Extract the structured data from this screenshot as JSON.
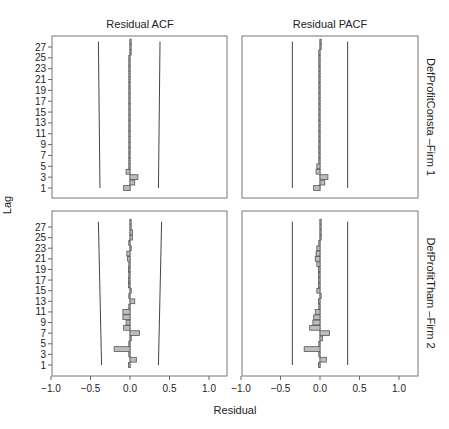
{
  "figure": {
    "col_titles": [
      "Residual ACF",
      "Residual PACF"
    ],
    "row_titles": [
      "DefProfitConsta –Firm 1",
      "DefProfitTham –Firm 2"
    ],
    "xlabel": "Residual",
    "ylabel": "Lag"
  },
  "chart_data": {
    "type": "bar",
    "orientation": "horizontal",
    "layout": "2x2 facet grid",
    "xlabel": "Residual",
    "ylabel": "Lag",
    "xlim": [
      -1.0,
      1.25
    ],
    "xticks": [
      -1.0,
      -0.5,
      0.0,
      0.5,
      1.0
    ],
    "xtick_labels": [
      "−1.0",
      "−0.5",
      "0.0",
      "0.5",
      "1.0"
    ],
    "yticks": [
      1,
      3,
      5,
      7,
      9,
      11,
      13,
      15,
      17,
      19,
      21,
      23,
      25,
      27
    ],
    "lags": [
      1,
      2,
      3,
      4,
      5,
      6,
      7,
      8,
      9,
      10,
      11,
      12,
      13,
      14,
      15,
      16,
      17,
      18,
      19,
      20,
      21,
      22,
      23,
      24,
      25,
      26,
      27,
      28
    ],
    "grid": false,
    "panels": [
      {
        "title": "Residual ACF",
        "row": "DefProfitConsta –Firm 1",
        "values": [
          -0.08,
          0.06,
          0.1,
          -0.05,
          -0.01,
          -0.01,
          -0.01,
          -0.01,
          -0.01,
          -0.01,
          -0.01,
          -0.01,
          -0.01,
          -0.01,
          -0.01,
          -0.01,
          -0.01,
          -0.01,
          -0.01,
          -0.01,
          -0.01,
          -0.01,
          -0.01,
          -0.01,
          -0.01,
          0.0,
          0.0,
          0.0
        ],
        "conf_band": {
          "lower_start": -0.38,
          "lower_end": -0.4,
          "upper_start": 0.36,
          "upper_end": 0.38
        }
      },
      {
        "title": "Residual PACF",
        "row": "DefProfitConsta –Firm 1",
        "values": [
          -0.08,
          0.06,
          0.1,
          -0.05,
          -0.04,
          -0.01,
          -0.01,
          -0.01,
          -0.01,
          -0.01,
          -0.01,
          -0.01,
          -0.01,
          -0.01,
          -0.01,
          -0.01,
          -0.01,
          -0.01,
          -0.01,
          -0.01,
          -0.01,
          -0.01,
          -0.01,
          -0.01,
          -0.01,
          -0.01,
          0.0,
          0.0
        ],
        "conf_band": {
          "lower": -0.35,
          "upper": 0.35
        }
      },
      {
        "title": "Residual ACF",
        "row": "DefProfitTham –Firm 2",
        "values": [
          -0.02,
          0.08,
          -0.01,
          -0.2,
          -0.01,
          0.0,
          0.12,
          -0.08,
          -0.05,
          -0.09,
          -0.09,
          -0.01,
          0.06,
          -0.01,
          0.0,
          -0.02,
          -0.02,
          -0.01,
          -0.02,
          -0.01,
          -0.03,
          -0.04,
          0.0,
          -0.01,
          0.03,
          0.03,
          0.0,
          0.0
        ],
        "conf_band": {
          "lower_start": -0.36,
          "lower_end": -0.4,
          "upper_start": 0.36,
          "upper_end": 0.4
        }
      },
      {
        "title": "Residual PACF",
        "row": "DefProfitTham –Firm 2",
        "values": [
          -0.02,
          0.08,
          -0.01,
          -0.2,
          -0.01,
          0.03,
          0.12,
          -0.13,
          -0.09,
          -0.08,
          -0.06,
          -0.01,
          -0.02,
          0.0,
          -0.04,
          -0.02,
          -0.02,
          -0.02,
          -0.02,
          -0.04,
          -0.06,
          -0.05,
          -0.04,
          -0.01,
          0.0,
          0.0,
          0.0,
          0.0
        ],
        "conf_band": {
          "lower": -0.35,
          "upper": 0.35
        }
      }
    ]
  }
}
